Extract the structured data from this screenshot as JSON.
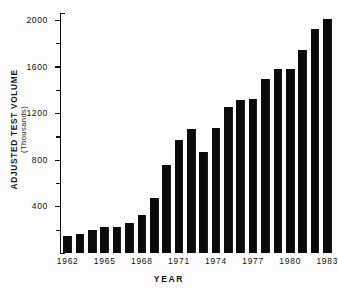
{
  "chart_data": {
    "type": "bar",
    "title": "",
    "xlabel": "YEAR",
    "ylabel": "ADJUSTED TEST VOLUME",
    "ylabel_units": "(Thousands)",
    "categories": [
      "1962",
      "1963",
      "1964",
      "1965",
      "1966",
      "1967",
      "1968",
      "1969",
      "1970",
      "1971",
      "1972",
      "1973",
      "1974",
      "1975",
      "1976",
      "1977",
      "1978",
      "1979",
      "1980",
      "1981",
      "1982",
      "1983"
    ],
    "values": [
      150,
      165,
      200,
      225,
      225,
      265,
      330,
      480,
      760,
      970,
      1065,
      870,
      1075,
      1260,
      1315,
      1325,
      1500,
      1580,
      1580,
      1745,
      1925,
      2010
    ],
    "ylim": [
      0,
      2060
    ],
    "y_major_ticks": [
      400,
      800,
      1200,
      1600,
      2000
    ],
    "y_minor_ticks": [
      200,
      600,
      1000,
      1400,
      1800
    ],
    "x_tick_labels": [
      "1962",
      "1965",
      "1968",
      "1971",
      "1974",
      "1977",
      "1980",
      "1983"
    ],
    "grid": false,
    "legend": false,
    "bar_color": "#0b0b0b",
    "axis_color": "#111111",
    "background": "#ffffff"
  },
  "axes": {
    "y_title_line1": "ADJUSTED TEST VOLUME",
    "y_title_line2": "(Thousands)",
    "x_title": "YEAR"
  }
}
